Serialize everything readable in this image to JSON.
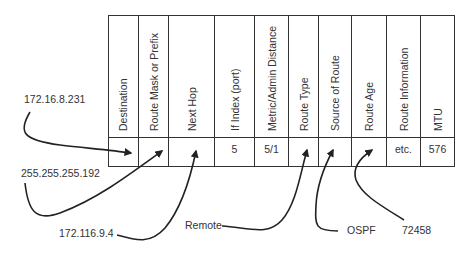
{
  "diagram": {
    "columns": [
      {
        "header": "Destination",
        "value": ""
      },
      {
        "header": "Route Mask or Prefix",
        "value": ""
      },
      {
        "header": "Next Hop",
        "value": ""
      },
      {
        "header": "If Index (port)",
        "value": "5"
      },
      {
        "header": "Metric/Admin Distance",
        "value": "5/1"
      },
      {
        "header": "Route Type",
        "value": ""
      },
      {
        "header": "Source of Route",
        "value": ""
      },
      {
        "header": "Route Age",
        "value": ""
      },
      {
        "header": "Route Information",
        "value": "etc."
      },
      {
        "header": "MTU",
        "value": "576"
      }
    ],
    "callouts": [
      {
        "text": "172.16.8.231",
        "points_to": "Destination"
      },
      {
        "text": "255.255.255.192",
        "points_to": "Route Mask or Prefix"
      },
      {
        "text": "172.116.9.4",
        "points_to": "Next Hop"
      },
      {
        "text": "Remote",
        "points_to": "Route Type"
      },
      {
        "text": "OSPF",
        "points_to": "Source of Route"
      },
      {
        "text": "72458",
        "points_to": "Route Age"
      }
    ],
    "colors": {
      "line": "#222222",
      "text": "#333333",
      "background": "#ffffff"
    }
  }
}
